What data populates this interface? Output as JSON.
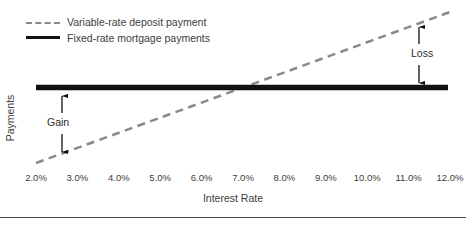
{
  "chart_data": {
    "type": "line",
    "title": "",
    "xlabel": "Interest Rate",
    "ylabel": "Payments",
    "xtick_labels": [
      "2.0%",
      "3.0%",
      "4.0%",
      "5.0%",
      "6.0%",
      "7.0%",
      "8.0%",
      "9.0%",
      "10.0%",
      "11.0%",
      "12.0%"
    ],
    "x": [
      2.0,
      3.0,
      4.0,
      5.0,
      6.0,
      7.0,
      8.0,
      9.0,
      10.0,
      11.0,
      12.0
    ],
    "xlim": [
      2.0,
      12.0
    ],
    "ylim": [
      0,
      100
    ],
    "grid": false,
    "legend_position": "top-left",
    "series": [
      {
        "name": "Variable-rate deposit payment",
        "style": "dashed",
        "color": "#8a8a8a",
        "values": [
          18,
          26,
          34,
          42,
          50,
          58,
          66,
          74,
          82,
          90,
          98
        ]
      },
      {
        "name": "Fixed-rate mortgage payments",
        "style": "solid",
        "color": "#111111",
        "values": [
          62,
          62,
          62,
          62,
          62,
          62,
          62,
          62,
          62,
          62,
          62
        ]
      }
    ],
    "annotations": [
      {
        "label": "Gain",
        "x": 2.75,
        "from_series": "Variable-rate deposit payment",
        "to_series": "Fixed-rate mortgage payments",
        "arrow": "double"
      },
      {
        "label": "Loss",
        "x": 11.35,
        "from_series": "Fixed-rate mortgage payments",
        "to_series": "Variable-rate deposit payment",
        "arrow": "double"
      }
    ],
    "intersection": {
      "x": 7.5,
      "y": 62
    }
  },
  "legend": {
    "items": [
      {
        "label": "Variable-rate deposit payment",
        "swatch": "dashed-line-swatch"
      },
      {
        "label": "Fixed-rate mortgage payments",
        "swatch": "solid-line-swatch"
      }
    ]
  },
  "axes": {
    "x_title": "Interest Rate",
    "y_title": "Payments"
  },
  "annotations": {
    "gain": "Gain",
    "loss": "Loss"
  }
}
